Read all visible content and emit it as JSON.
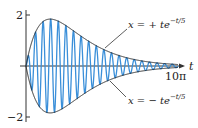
{
  "chart_data": {
    "type": "line",
    "title": "",
    "xlabel": "t",
    "ylabel": "",
    "xlim": [
      0,
      31.4159
    ],
    "ylim": [
      -2,
      2
    ],
    "grid": false,
    "legend": "none",
    "x_ticks": [
      {
        "value": 31.4159,
        "label": "10π"
      }
    ],
    "y_ticks": [
      {
        "value": 2,
        "label": "2"
      },
      {
        "value": -2,
        "label": "-2"
      }
    ],
    "series": [
      {
        "name": "x = t e^{-t/5} sin(4t)",
        "color": "#3a8fd9",
        "expression": "t*exp(-t/5)*sin(4*t)"
      },
      {
        "name": "x = + t e^{-t/5}",
        "color": "#222222",
        "expression": "t*exp(-t/5)"
      },
      {
        "name": "x = - t e^{-t/5}",
        "color": "#222222",
        "expression": "-t*exp(-t/5)"
      }
    ],
    "annotations": [
      {
        "text_parts": [
          "x",
          " = + ",
          "t",
          "e",
          "−t/5"
        ],
        "position": "upper envelope"
      },
      {
        "text_parts": [
          "x",
          " = − ",
          "t",
          "e",
          "−t/5"
        ],
        "position": "lower envelope"
      }
    ]
  },
  "labels": {
    "axis_t": "t",
    "tick_top": "2",
    "tick_bottom": "−2",
    "tick_xend": "10π",
    "upper": {
      "var": "x",
      "eq": " = + ",
      "t": "t",
      "e": "e",
      "exp": "−t/5"
    },
    "lower": {
      "var": "x",
      "eq": " = − ",
      "t": "t",
      "e": "e",
      "exp": "−t/5"
    }
  },
  "colors": {
    "wave": "#3a8fd9",
    "envelope": "#222222",
    "axis": "#333333"
  }
}
